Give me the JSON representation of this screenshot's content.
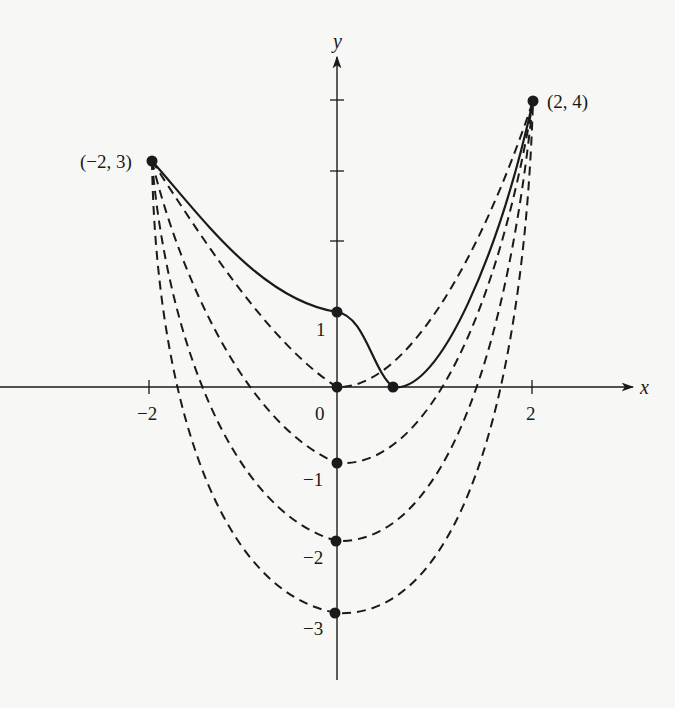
{
  "figure": {
    "background": "#f7f7f5",
    "ink": "#1a1a1a",
    "axes": {
      "x_label": "x",
      "y_label": "y",
      "x_ticks": [
        {
          "value": -2,
          "label": "−2"
        },
        {
          "value": 0,
          "label": "0"
        },
        {
          "value": 2,
          "label": "2"
        }
      ],
      "y_ticks": [
        {
          "value": 1,
          "label": "1"
        },
        {
          "value": -1,
          "label": "−1"
        },
        {
          "value": -2,
          "label": "−2"
        },
        {
          "value": -3,
          "label": "−3"
        }
      ],
      "unlabeled_y_ticks": [
        2,
        3,
        4
      ]
    },
    "endpoints": [
      {
        "x": -2,
        "y": 3,
        "label": "(−2, 3)"
      },
      {
        "x": 2,
        "y": 4,
        "label": "(2, 4)"
      }
    ],
    "solid_curve": {
      "style": "solid",
      "description": "curve from (-2,3) through (0,1) to minimum (~0.6,0) then up to (2,4)",
      "marked_points": [
        [
          0,
          1
        ],
        [
          0.6,
          0
        ]
      ]
    },
    "dashed_curves": [
      {
        "style": "dashed",
        "vertex": [
          0,
          0
        ]
      },
      {
        "style": "dashed",
        "vertex": [
          0,
          -1
        ]
      },
      {
        "style": "dashed",
        "vertex": [
          0,
          -2
        ]
      },
      {
        "style": "dashed",
        "vertex": [
          0,
          -3
        ]
      }
    ]
  }
}
